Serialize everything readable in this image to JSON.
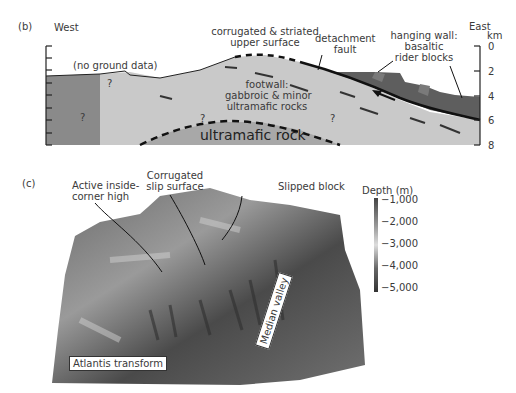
{
  "panel_b": {
    "label": "(b)",
    "west": "West",
    "east": "East",
    "axis_unit": "km",
    "depth_ticks": [
      "0",
      "2",
      "4",
      "6",
      "8"
    ],
    "annotations": {
      "no_ground": "(no ground data)",
      "corrugated_1": "corrugated & striated",
      "corrugated_2": "upper surface",
      "detachment_1": "detachment",
      "detachment_2": "fault",
      "hanging_1": "hanging wall:",
      "hanging_2": "basaltic",
      "hanging_3": "rider blocks",
      "footwall_1": "footwall:",
      "footwall_2": "gabbroic & minor",
      "footwall_3": "ultramafic rocks",
      "ultramafic": "ultramafic rock",
      "unknown": "?"
    },
    "colors": {
      "west_block": "#8a8a8a",
      "footwall": "#c9c9c9",
      "ultramafic": "#a8a8a8",
      "hanging_wall": "#5e5e5e"
    }
  },
  "panel_c": {
    "label": "(c)",
    "callouts": {
      "inside_corner_1": "Active inside-",
      "inside_corner_2": "corner high",
      "corrugated_1": "Corrugated",
      "corrugated_2": "slip surface",
      "slipped": "Slipped block"
    },
    "tags": {
      "atlantis": "Atlantis transform",
      "median": "Median valley"
    },
    "colorbar": {
      "title": "Depth (m)",
      "ticks": [
        "−1,000",
        "−2,000",
        "−3,000",
        "−4,000",
        "−5,000"
      ]
    }
  }
}
